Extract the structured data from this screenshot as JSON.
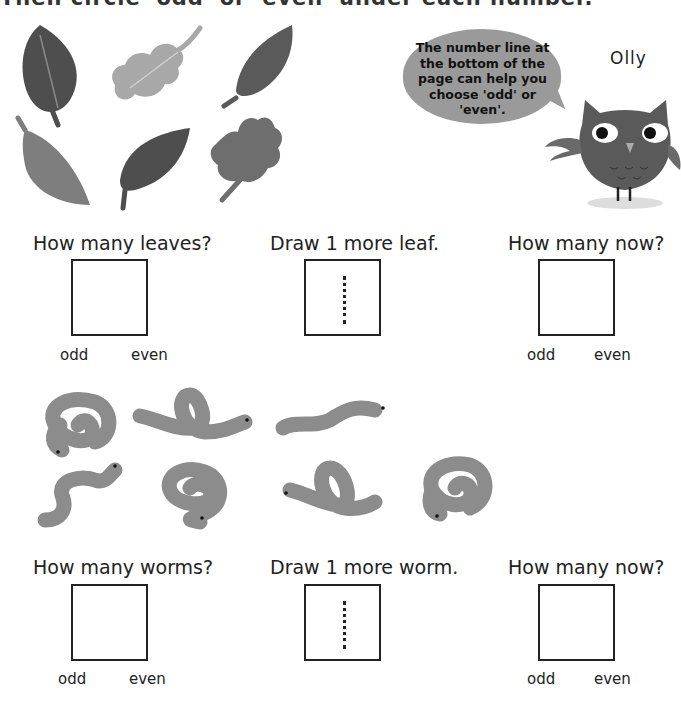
{
  "header": {
    "instruction": "Then circle 'odd' or 'even' under each number."
  },
  "owl": {
    "name": "Olly",
    "speech": "The number line at the bottom of the page can help you choose 'odd' or 'even'."
  },
  "leaves_section": {
    "picture_count": 6,
    "questions": [
      {
        "label": "How many leaves?",
        "choices": [
          "odd",
          "even"
        ]
      },
      {
        "label": "Draw 1 more leaf."
      },
      {
        "label": "How many now?",
        "choices": [
          "odd",
          "even"
        ]
      }
    ]
  },
  "worms_section": {
    "picture_count": 7,
    "questions": [
      {
        "label": "How many worms?",
        "choices": [
          "odd",
          "even"
        ]
      },
      {
        "label": "Draw 1 more worm."
      },
      {
        "label": "How many now?",
        "choices": [
          "odd",
          "even"
        ]
      }
    ]
  },
  "colors": {
    "leaf_dark": "#4e4e4e",
    "leaf_mid": "#6e6e6e",
    "leaf_light": "#a8a8a8",
    "worm": "#8c8c8c",
    "bubble": "#9a9a9a",
    "owl_body": "#5a5a5a"
  }
}
